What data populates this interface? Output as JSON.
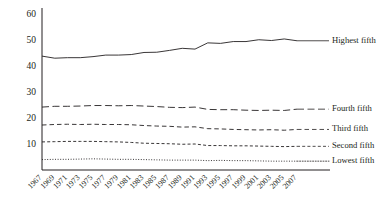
{
  "chart_data": {
    "type": "line",
    "title": "",
    "subtitle": "",
    "xlabel": "",
    "ylabel": "",
    "grid": false,
    "legend_position": "right-inline",
    "ylim": [
      0,
      60
    ],
    "yticks": [
      10,
      20,
      30,
      40,
      50,
      60
    ],
    "xlim": [
      1967,
      2007
    ],
    "x": [
      1967,
      1969,
      1971,
      1973,
      1975,
      1977,
      1979,
      1981,
      1983,
      1985,
      1987,
      1989,
      1991,
      1993,
      1995,
      1997,
      1999,
      2001,
      2003,
      2005,
      2007
    ],
    "xticks": [
      "1967",
      "1969",
      "1971",
      "1973",
      "1975",
      "1977",
      "1979",
      "1981",
      "1983",
      "1985",
      "1987",
      "1989",
      "1991",
      "1993",
      "1995",
      "1997",
      "1999",
      "2001",
      "2003",
      "2005",
      "2007"
    ],
    "series": [
      {
        "name": "Highest fifth",
        "style": "solid",
        "values": [
          43.8,
          43.0,
          43.2,
          43.2,
          43.6,
          44.2,
          44.2,
          44.4,
          45.2,
          45.3,
          46.0,
          46.8,
          46.5,
          48.9,
          48.7,
          49.4,
          49.4,
          50.1,
          49.8,
          50.4,
          49.7
        ]
      },
      {
        "name": "Fourth fifth",
        "style": "dashed-long",
        "values": [
          24.2,
          24.5,
          24.5,
          24.6,
          24.8,
          24.8,
          24.7,
          24.8,
          24.6,
          24.4,
          24.1,
          24.0,
          24.2,
          23.3,
          23.2,
          23.2,
          23.0,
          22.9,
          23.0,
          22.9,
          23.4
        ]
      },
      {
        "name": "Third fifth",
        "style": "dashed-medium",
        "values": [
          17.3,
          17.5,
          17.6,
          17.5,
          17.6,
          17.5,
          17.5,
          17.4,
          17.1,
          16.9,
          16.8,
          16.5,
          16.6,
          15.9,
          15.8,
          15.6,
          15.5,
          15.4,
          15.5,
          15.3,
          15.6
        ]
      },
      {
        "name": "Second fifth",
        "style": "dashed-short",
        "values": [
          10.8,
          10.9,
          11.0,
          11.0,
          11.0,
          10.9,
          10.8,
          10.6,
          10.3,
          10.2,
          10.1,
          9.9,
          10.0,
          9.4,
          9.4,
          9.3,
          9.3,
          9.2,
          9.1,
          9.0,
          9.1
        ]
      },
      {
        "name": "Lowest fifth",
        "style": "dotted",
        "values": [
          4.0,
          4.1,
          4.1,
          4.2,
          4.3,
          4.2,
          4.1,
          4.1,
          4.0,
          3.9,
          3.8,
          3.8,
          3.8,
          3.6,
          3.7,
          3.6,
          3.6,
          3.5,
          3.4,
          3.4,
          3.4
        ]
      }
    ],
    "legend": [
      {
        "label": "Highest fifth",
        "style": "solid"
      },
      {
        "label": "Fourth fifth",
        "style": "dashed-long"
      },
      {
        "label": "Third fifth",
        "style": "dashed-medium"
      },
      {
        "label": "Second fifth",
        "style": "dashed-short"
      },
      {
        "label": "Lowest fifth",
        "style": "dotted"
      }
    ],
    "colors": {
      "ink": "#231f20",
      "background": "#ffffff"
    }
  }
}
